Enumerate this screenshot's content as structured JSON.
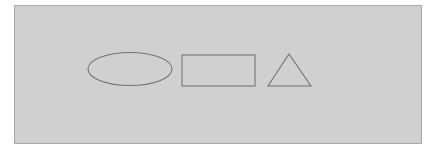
{
  "diagram": {
    "canvas": {
      "width": 430,
      "height": 152,
      "background_color": "#ffffff"
    },
    "panel": {
      "name": "shape-panel",
      "x": 14,
      "y": 5,
      "width": 408,
      "height": 139,
      "fill_color": "#d0d0d0",
      "border_color": "#a9a9a9",
      "border_width": 1
    },
    "stroke_color": "#737373",
    "stroke_width": 1.1,
    "shapes": [
      {
        "id": "ellipse",
        "label": "Ellipse",
        "type": "ellipse",
        "center_x": 115,
        "center_y": 63,
        "radius_x": 42,
        "radius_y": 16.5,
        "fill": "none"
      },
      {
        "id": "rectangle",
        "label": "Rectangle",
        "type": "rect",
        "x": 167,
        "y": 49,
        "width": 73,
        "height": 31,
        "fill": "none"
      },
      {
        "id": "triangle",
        "label": "Triangle",
        "type": "polygon",
        "points": "274,48 296,80 253,80",
        "apex_x": 274,
        "apex_y": 48,
        "base_left_x": 253,
        "base_right_x": 296,
        "base_y": 80,
        "fill": "none"
      }
    ]
  }
}
